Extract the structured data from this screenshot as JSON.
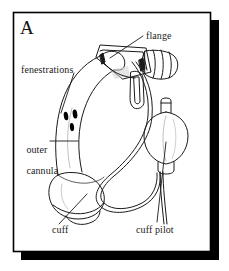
{
  "figure": {
    "panel_letter": "A",
    "frame": {
      "border_color": "#000000",
      "fill_color": "#ffffff",
      "shadow_color": "#000000",
      "x": 13,
      "y": 12,
      "width": 198,
      "height": 240,
      "shadow_offset_x": 8,
      "shadow_offset_y": 8
    },
    "ink_color": "#1a1a1a",
    "fenestration_fill": "#000000",
    "labels": [
      {
        "id": "flange",
        "text": "flange",
        "x": 146,
        "y": 34
      },
      {
        "id": "fenestrations",
        "text": "fenestrations",
        "x": 21,
        "y": 68
      },
      {
        "id": "outer-cannula",
        "line1": "outer",
        "line2": "cannula",
        "x": 16,
        "y": 137
      },
      {
        "id": "cuff",
        "text": "cuff",
        "x": 52,
        "y": 227
      },
      {
        "id": "cuff-pilot",
        "text": "cuff pilot",
        "x": 136,
        "y": 227
      }
    ],
    "leader_lines": [
      {
        "id": "flange-leader",
        "from": [
          143,
          36
        ],
        "to": [
          110,
          58
        ]
      },
      {
        "id": "fenestrations-leader",
        "from": [
          73,
          73
        ],
        "to": [
          62,
          113
        ]
      },
      {
        "id": "outer-cannula-leader",
        "from": [
          50,
          141
        ],
        "to": [
          78,
          141
        ]
      },
      {
        "id": "cuff-leader",
        "from": [
          60,
          224
        ],
        "to": [
          86,
          196
        ]
      },
      {
        "id": "cuff-pilot-leader",
        "from": [
          156,
          224
        ],
        "to": [
          166,
          143
        ]
      }
    ],
    "parts": [
      {
        "id": "outer-cannula",
        "name": "outer cannula",
        "description": "curved tube body"
      },
      {
        "id": "fenestrations",
        "name": "fenestrations",
        "description": "three small oval openings",
        "count": 3
      },
      {
        "id": "flange",
        "name": "flange",
        "description": "neck plate at tube hub"
      },
      {
        "id": "connector-hub",
        "name": "connector hub",
        "description": "ridged 15 mm connector"
      },
      {
        "id": "cuff",
        "name": "cuff",
        "description": "inflated balloon near distal tip"
      },
      {
        "id": "cuff-pilot",
        "name": "cuff pilot",
        "description": "pilot balloon with valve stem"
      },
      {
        "id": "inflation-line",
        "name": "inflation line",
        "description": "looping tubing from cuff to pilot"
      }
    ]
  }
}
